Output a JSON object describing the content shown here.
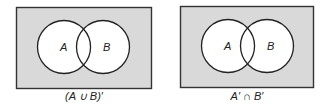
{
  "colors": {
    "shade": "#d9d9d9",
    "border": "#333333",
    "circle_fill": "#ffffff",
    "circle_stroke": "#222222"
  },
  "diagrams": [
    {
      "set_a_label": "A",
      "set_b_label": "B",
      "caption": "(A ∪ B)′",
      "shaded_region": "outside A and B"
    },
    {
      "set_a_label": "A",
      "set_b_label": "B",
      "caption": "A′ ∩ B′",
      "shaded_region": "outside A and B"
    }
  ]
}
